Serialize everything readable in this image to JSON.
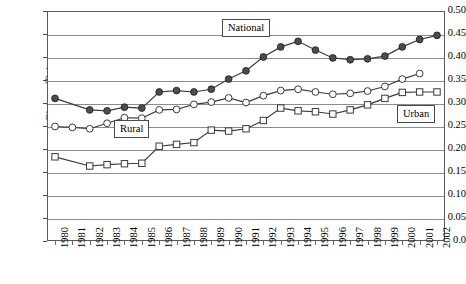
{
  "chart_data": {
    "type": "line",
    "title": "",
    "xlabel": "",
    "ylabel": "Gini coefficient",
    "ylim": [
      0.0,
      0.5
    ],
    "ytick_step": 0.05,
    "grid": true,
    "legend_position": "inline-callouts",
    "x": [
      1980,
      1981,
      1982,
      1983,
      1984,
      1985,
      1986,
      1987,
      1988,
      1989,
      1990,
      1991,
      1992,
      1993,
      1994,
      1995,
      1996,
      1997,
      1998,
      1999,
      2000,
      2001,
      2002
    ],
    "categories": [
      "1980",
      "1981",
      "1982",
      "1983",
      "1984",
      "1985",
      "1986",
      "1987",
      "1988",
      "1989",
      "1990",
      "1991",
      "1992",
      "1993",
      "1994",
      "1995",
      "1996",
      "1997",
      "1998",
      "1999",
      "2000",
      "2001",
      "2002"
    ],
    "series": [
      {
        "name": "National",
        "marker": "filled-circle",
        "values": [
          0.31,
          null,
          0.285,
          0.283,
          0.291,
          0.289,
          0.324,
          0.327,
          0.324,
          0.33,
          0.352,
          0.37,
          0.4,
          0.422,
          0.434,
          0.415,
          0.398,
          0.394,
          0.396,
          0.402,
          0.422,
          0.438,
          0.447
        ]
      },
      {
        "name": "Urban",
        "marker": "open-circle",
        "values": [
          0.249,
          0.247,
          0.244,
          0.256,
          0.268,
          0.267,
          0.285,
          0.286,
          0.297,
          0.302,
          0.311,
          0.301,
          0.316,
          0.327,
          0.33,
          0.324,
          0.319,
          0.321,
          0.326,
          0.336,
          0.352,
          0.364,
          null
        ]
      },
      {
        "name": "Rural",
        "marker": "open-square",
        "values": [
          0.183,
          null,
          0.163,
          0.166,
          0.168,
          0.169,
          0.206,
          0.21,
          0.214,
          0.241,
          0.239,
          0.244,
          0.262,
          0.289,
          0.283,
          0.281,
          0.276,
          0.285,
          0.296,
          0.31,
          0.323,
          0.324,
          0.324
        ]
      }
    ],
    "ytick_labels": [
      "0.0",
      "0.05",
      "0.10",
      "0.15",
      "0.20",
      "0.25",
      "0.30",
      "0.35",
      "0.40",
      "0.45",
      "0.50"
    ],
    "ytick_values": [
      0.0,
      0.05,
      0.1,
      0.15,
      0.2,
      0.25,
      0.3,
      0.35,
      0.4,
      0.45,
      0.5
    ],
    "annotations": [
      {
        "name": "National",
        "text": "National"
      },
      {
        "name": "Rural",
        "text": "Rural"
      },
      {
        "name": "Urban",
        "text": "Urban"
      }
    ]
  },
  "axis": {
    "y_title": "Gini coefficient"
  },
  "labels": {
    "national": "National",
    "rural": "Rural",
    "urban": "Urban"
  },
  "caption": {
    "text": ""
  },
  "colors": {
    "line": "#3a3a3a",
    "filled_marker": "#4d4d4d",
    "grid": "#8c8c8c",
    "frame": "#5a5a5a",
    "background": "#ffffff"
  }
}
